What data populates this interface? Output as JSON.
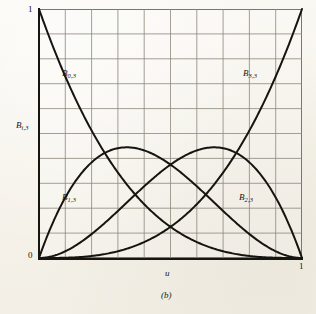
{
  "figure": {
    "caption": "(b)",
    "background_color": "#f8f6f0",
    "grid_color": "#8d887c",
    "curve_color": "#16140f",
    "axis_color": "#17150f"
  },
  "axes": {
    "x_title": "u",
    "y_title_base": "B",
    "y_title_sub": "i,3",
    "x_tick_min": "0",
    "x_tick_max": "1",
    "y_tick_min": "0",
    "y_tick_max": "1"
  },
  "labels": {
    "b03_base": "B",
    "b03_sub": "0,3",
    "b13_base": "B",
    "b13_sub": "1,3",
    "b23_base": "B",
    "b23_sub": "2,3",
    "b33_base": "B",
    "b33_sub": "3,3"
  },
  "chart_data": {
    "type": "line",
    "title": "",
    "subtitle": "",
    "xlabel": "u",
    "ylabel": "B_{i,3}",
    "xlim": [
      0,
      1
    ],
    "ylim": [
      0,
      1
    ],
    "grid": true,
    "grid_divisions_x": 10,
    "grid_divisions_y": 10,
    "xticks": [
      0,
      1
    ],
    "xticklabels": [
      "0",
      "1"
    ],
    "yticks": [
      0,
      1
    ],
    "yticklabels": [
      "0",
      "1"
    ],
    "legend": "none",
    "annotations": [
      {
        "text": "B_{0,3}",
        "x": 0.09,
        "y": 0.74
      },
      {
        "text": "B_{3,3}",
        "x": 0.78,
        "y": 0.74
      },
      {
        "text": "B_{1,3}",
        "x": 0.09,
        "y": 0.24
      },
      {
        "text": "B_{2,3}",
        "x": 0.77,
        "y": 0.24
      }
    ],
    "x": [
      0,
      0.05,
      0.1,
      0.15,
      0.2,
      0.25,
      0.3,
      0.3333,
      0.35,
      0.4,
      0.45,
      0.5,
      0.55,
      0.6,
      0.6333,
      0.6667,
      0.7,
      0.75,
      0.8,
      0.85,
      0.9,
      0.95,
      1
    ],
    "series": [
      {
        "name": "B_{0,3}",
        "formula": "(1-u)^3",
        "values": [
          1,
          0.857375,
          0.729,
          0.614125,
          0.512,
          0.421875,
          0.343,
          0.296296,
          0.274625,
          0.216,
          0.166375,
          0.125,
          0.091125,
          0.064,
          0.049,
          0.037037,
          0.027,
          0.015625,
          0.008,
          0.003375,
          0.001,
          0.000125,
          0
        ]
      },
      {
        "name": "B_{1,3}",
        "formula": "3u(1-u)^2",
        "values": [
          0,
          0.135375,
          0.243,
          0.325125,
          0.384,
          0.421875,
          0.441,
          0.444444,
          0.443625,
          0.432,
          0.408375,
          0.375,
          0.334125,
          0.288,
          0.2592,
          0.2222,
          0.189,
          0.140625,
          0.096,
          0.057375,
          0.027,
          0.007125,
          0
        ]
      },
      {
        "name": "B_{2,3}",
        "formula": "3u^2(1-u)",
        "values": [
          0,
          0.007125,
          0.027,
          0.057375,
          0.096,
          0.140625,
          0.189,
          0.222222,
          0.238875,
          0.288,
          0.334125,
          0.375,
          0.408375,
          0.432,
          0.4399,
          0.4444,
          0.441,
          0.421875,
          0.384,
          0.325125,
          0.243,
          0.135375,
          0
        ]
      },
      {
        "name": "B_{3,3}",
        "formula": "u^3",
        "values": [
          0,
          0.000125,
          0.001,
          0.003375,
          0.008,
          0.015625,
          0.027,
          0.037037,
          0.042875,
          0.064,
          0.091125,
          0.125,
          0.166375,
          0.216,
          0.2539,
          0.2963,
          0.343,
          0.421875,
          0.512,
          0.614125,
          0.729,
          0.857375,
          1
        ]
      }
    ],
    "maximum_of_middle_curves": 0.4444,
    "peak_positions": {
      "B_{1,3}": 0.3333,
      "B_{2,3}": 0.6667
    }
  }
}
